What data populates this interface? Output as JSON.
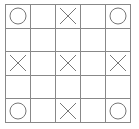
{
  "board": {
    "rows": 5,
    "cols": 5,
    "line_color": "#888888",
    "mark_color": "#777777",
    "cells": [
      [
        "O",
        "",
        "X",
        "",
        "O"
      ],
      [
        "",
        "",
        "",
        "",
        ""
      ],
      [
        "X",
        "",
        "X",
        "",
        "X"
      ],
      [
        "",
        "",
        "",
        "",
        ""
      ],
      [
        "O",
        "",
        "X",
        "",
        "O"
      ]
    ]
  }
}
